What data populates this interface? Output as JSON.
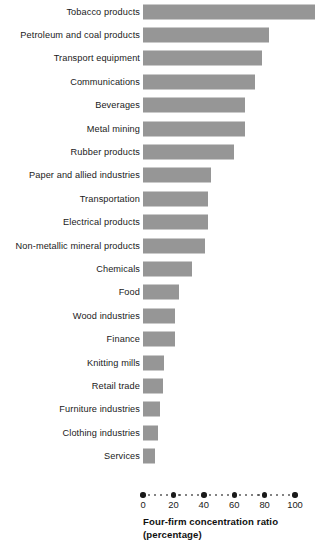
{
  "chart_data": {
    "type": "bar",
    "orientation": "horizontal",
    "title": "",
    "xlabel_line1": "Four-firm concentration ratio",
    "xlabel_line2": "(percentage)",
    "ylabel": "",
    "xlim": [
      0,
      113
    ],
    "axis_max_tick": 100,
    "grid": false,
    "legend": false,
    "bar_color": "#969696",
    "text_color": "#1a1a1a",
    "tick_values": [
      0,
      20,
      40,
      60,
      80,
      100
    ],
    "tick_labels": [
      "0",
      "20",
      "40",
      "60",
      "80",
      "100"
    ],
    "minor_dots_per_interval": 4,
    "categories": [
      "Tobacco products",
      "Petroleum and coal products",
      "Transport equipment",
      "Communications",
      "Beverages",
      "Metal mining",
      "Rubber products",
      "Paper and allied industries",
      "Transportation",
      "Electrical products",
      "Non-metallic mineral products",
      "Chemicals",
      "Food",
      "Wood industries",
      "Finance",
      "Knitting mills",
      "Retail trade",
      "Furniture industries",
      "Clothing industries",
      "Services"
    ],
    "values": [
      113,
      83,
      78,
      74,
      67,
      67,
      60,
      45,
      43,
      43,
      41,
      32,
      24,
      21,
      21,
      14,
      13,
      11,
      10,
      8
    ]
  }
}
